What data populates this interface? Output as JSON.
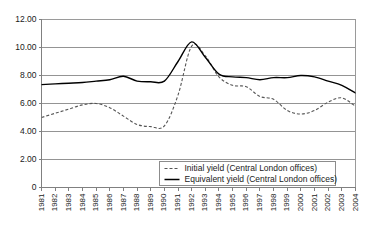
{
  "chart_data": {
    "type": "line",
    "title": "",
    "subtitle": "",
    "xlabel": "",
    "ylabel": "",
    "grid": true,
    "legend_position": "bottom-center",
    "ylim": [
      0,
      12
    ],
    "yticks": [
      "0",
      "2.00",
      "4.00",
      "6.00",
      "8.00",
      "10.00",
      "12.00"
    ],
    "ytick_values": [
      0,
      2,
      4,
      6,
      8,
      10,
      12
    ],
    "x": [
      "1981",
      "1982",
      "1983",
      "1984",
      "1985",
      "1986",
      "1987",
      "1988",
      "1989",
      "1990",
      "1991",
      "1992",
      "1993",
      "1994",
      "1995",
      "1996",
      "1997",
      "1998",
      "1999",
      "2000",
      "2001",
      "2002",
      "2003",
      "2004"
    ],
    "categories": [
      "1981",
      "1982",
      "1983",
      "1984",
      "1985",
      "1986",
      "1987",
      "1988",
      "1989",
      "1990",
      "1991",
      "1992",
      "1993",
      "1994",
      "1995",
      "1996",
      "1997",
      "1998",
      "1999",
      "2000",
      "2001",
      "2002",
      "2003",
      "2004"
    ],
    "series": [
      {
        "name": "Initial yield (Central London offices)",
        "style": "dashed",
        "color": "#555555",
        "values": [
          5.0,
          5.3,
          5.6,
          5.9,
          6.0,
          5.7,
          5.1,
          4.5,
          4.35,
          4.4,
          6.6,
          10.1,
          9.4,
          7.9,
          7.3,
          7.2,
          6.5,
          6.3,
          5.5,
          5.25,
          5.5,
          6.1,
          6.4,
          5.8
        ]
      },
      {
        "name": "Equivalent yield (Central London offices)",
        "style": "solid",
        "color": "#000000",
        "values": [
          7.35,
          7.4,
          7.45,
          7.5,
          7.6,
          7.7,
          7.95,
          7.6,
          7.55,
          7.6,
          9.0,
          10.4,
          9.3,
          8.1,
          7.9,
          7.85,
          7.7,
          7.85,
          7.85,
          8.0,
          7.9,
          7.6,
          7.3,
          6.75
        ]
      }
    ]
  },
  "legend": {
    "items": [
      {
        "label": "Initial yield (Central London offices)",
        "style": "dashed"
      },
      {
        "label": "Equivalent yield (Central London offices)",
        "style": "solid"
      }
    ]
  }
}
